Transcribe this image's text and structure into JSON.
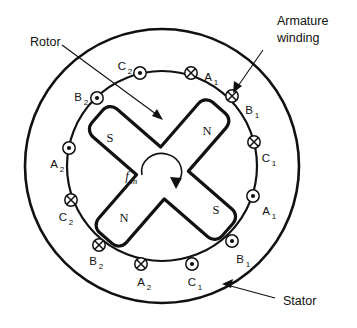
{
  "figure": {
    "background_color": "#ffffff",
    "line_color": "#111111"
  },
  "callouts": {
    "rotor": {
      "label": "Rotor"
    },
    "armature_winding": {
      "label_line1": "Armature",
      "label_line2": "winding"
    },
    "stator": {
      "label": "Stator"
    }
  },
  "rotor": {
    "rotation_symbol": "f",
    "rotation_subscript": "m",
    "rotation_direction": "clockwise",
    "poles": [
      {
        "label": "S",
        "position": "upper-left"
      },
      {
        "label": "N",
        "position": "upper-right"
      },
      {
        "label": "N",
        "position": "lower-left"
      },
      {
        "label": "S",
        "position": "lower-right"
      }
    ]
  },
  "stator": {
    "slots": [
      {
        "phase": "C",
        "subscript": "2",
        "current": "out",
        "marker": "dot",
        "angle_deg": 103
      },
      {
        "phase": "A",
        "subscript": "1",
        "current": "in",
        "marker": "cross",
        "angle_deg": 73
      },
      {
        "phase": "B",
        "subscript": "1",
        "current": "in",
        "marker": "cross",
        "angle_deg": 47
      },
      {
        "phase": "C",
        "subscript": "1",
        "current": "in",
        "marker": "cross",
        "angle_deg": 15
      },
      {
        "phase": "A",
        "subscript": "1",
        "current": "out",
        "marker": "dot",
        "angle_deg": -16
      },
      {
        "phase": "B",
        "subscript": "1",
        "current": "out",
        "marker": "dot",
        "angle_deg": -47
      },
      {
        "phase": "C",
        "subscript": "1",
        "current": "out",
        "marker": "dot",
        "angle_deg": -75
      },
      {
        "phase": "A",
        "subscript": "2",
        "current": "in",
        "marker": "cross",
        "angle_deg": -104
      },
      {
        "phase": "B",
        "subscript": "2",
        "current": "in",
        "marker": "cross",
        "angle_deg": -131
      },
      {
        "phase": "C",
        "subscript": "2",
        "current": "in",
        "marker": "cross",
        "angle_deg": -162
      },
      {
        "phase": "A",
        "subscript": "2",
        "current": "out",
        "marker": "dot",
        "angle_deg": 165
      },
      {
        "phase": "B",
        "subscript": "2",
        "current": "out",
        "marker": "dot",
        "angle_deg": 133
      }
    ]
  },
  "slot_text": {
    "s1_p": "C",
    "s1_s": "2",
    "s2_p": "A",
    "s2_s": "1",
    "s3_p": "B",
    "s3_s": "1",
    "s4_p": "C",
    "s4_s": "1",
    "s5_p": "A",
    "s5_s": "1",
    "s6_p": "B",
    "s6_s": "1",
    "s7_p": "C",
    "s7_s": "1",
    "s8_p": "A",
    "s8_s": "2",
    "s9_p": "B",
    "s9_s": "2",
    "s10_p": "C",
    "s10_s": "2",
    "s11_p": "A",
    "s11_s": "2",
    "s12_p": "B",
    "s12_s": "2"
  },
  "pole_text": {
    "ul": "S",
    "ur": "N",
    "ll": "N",
    "lr": "S"
  }
}
